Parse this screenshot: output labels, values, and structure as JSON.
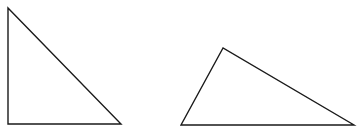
{
  "canvas": {
    "width": 362,
    "height": 138,
    "background": "#ffffff"
  },
  "stroke": {
    "color": "#1a1a1a",
    "width": 1.4
  },
  "triangles": [
    {
      "name": "right-triangle",
      "points": [
        [
          8,
          8
        ],
        [
          8,
          124
        ],
        [
          121,
          124
        ]
      ]
    },
    {
      "name": "obtuse-scalene-triangle",
      "points": [
        [
          223,
          48
        ],
        [
          181,
          125
        ],
        [
          354,
          125
        ]
      ]
    }
  ]
}
